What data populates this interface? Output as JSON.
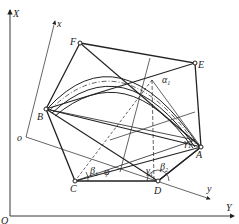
{
  "diagram": {
    "type": "geometric construction (linkage / hexagon with arcs)",
    "colors": {
      "line": "#222222",
      "background": "#ffffff"
    },
    "axes": {
      "global": {
        "origin_label": "O",
        "vertical_label": "X",
        "horizontal_label": "Y"
      },
      "local": {
        "origin_label": "o",
        "x_label": "x",
        "y_label": "y"
      }
    },
    "points": {
      "A": "A",
      "B": "B",
      "C": "C",
      "D": "D",
      "E": "E",
      "F": "F"
    },
    "angles": {
      "alpha1": {
        "sym": "α",
        "sub": "1"
      },
      "beta1": {
        "sym": "β",
        "sub": "1"
      },
      "beta2": {
        "sym": "β",
        "sub": "2"
      },
      "gamma1_d": {
        "sym": "γ",
        "sub": "1"
      },
      "gamma1_a": {
        "sym": "γ",
        "sub": "1"
      },
      "phi": {
        "sym": "φ"
      }
    }
  }
}
